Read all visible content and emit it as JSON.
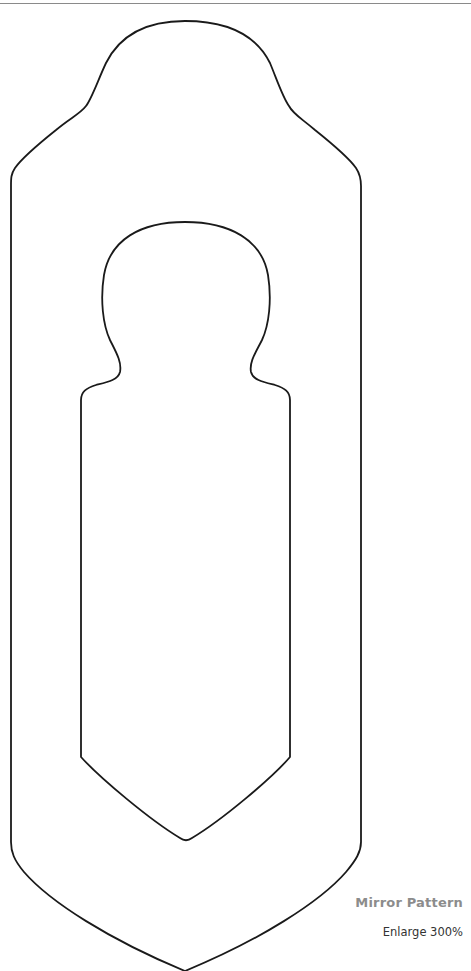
{
  "page": {
    "caption": {
      "title": "Mirror Pattern",
      "subtitle": "Enlarge 300%"
    },
    "colors": {
      "outline": "#1a1a1a",
      "caption_title": "#8c8c8c",
      "caption_sub": "#333333",
      "rule": "#8a8a8a"
    }
  }
}
